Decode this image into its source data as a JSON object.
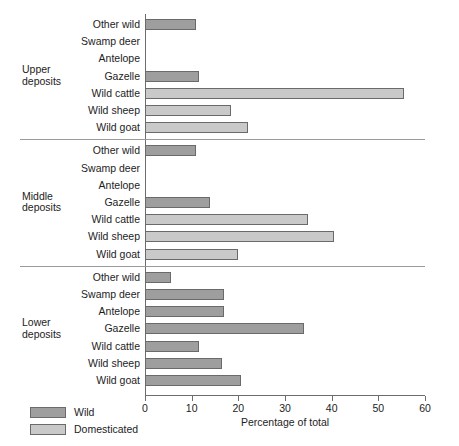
{
  "chart_data": {
    "type": "bar",
    "orientation": "horizontal",
    "title": "",
    "xlabel": "Percentage of total",
    "ylabel": "",
    "xlim": [
      0,
      60
    ],
    "xticks": [
      0,
      10,
      20,
      30,
      40,
      50,
      60
    ],
    "xticklabels": [
      "0",
      "10",
      "20",
      "30",
      "40",
      "50",
      "60"
    ],
    "grid": false,
    "legend": {
      "position": "bottom-left",
      "entries": [
        {
          "name": "Wild",
          "color": "#9e9e9e"
        },
        {
          "name": "Domesticated",
          "color": "#c9c9c9"
        }
      ]
    },
    "categories": [
      "Other wild",
      "Swamp deer",
      "Antelope",
      "Gazelle",
      "Wild cattle",
      "Wild sheep",
      "Wild goat"
    ],
    "groups": [
      {
        "name": "Upper\ndeposits",
        "name_lines": [
          "Upper",
          "deposits"
        ],
        "bars": [
          {
            "category": "Other wild",
            "value": 11,
            "series": "Wild"
          },
          {
            "category": "Swamp deer",
            "value": 0,
            "series": "Wild"
          },
          {
            "category": "Antelope",
            "value": 0,
            "series": "Wild"
          },
          {
            "category": "Gazelle",
            "value": 11.5,
            "series": "Wild"
          },
          {
            "category": "Wild cattle",
            "value": 55.5,
            "series": "Domesticated"
          },
          {
            "category": "Wild sheep",
            "value": 18.5,
            "series": "Domesticated"
          },
          {
            "category": "Wild goat",
            "value": 22,
            "series": "Domesticated"
          }
        ]
      },
      {
        "name": "Middle\ndeposits",
        "name_lines": [
          "Middle",
          "deposits"
        ],
        "bars": [
          {
            "category": "Other wild",
            "value": 11,
            "series": "Wild"
          },
          {
            "category": "Swamp deer",
            "value": 0,
            "series": "Wild"
          },
          {
            "category": "Antelope",
            "value": 0,
            "series": "Wild"
          },
          {
            "category": "Gazelle",
            "value": 14,
            "series": "Wild"
          },
          {
            "category": "Wild cattle",
            "value": 35,
            "series": "Domesticated"
          },
          {
            "category": "Wild sheep",
            "value": 40.5,
            "series": "Domesticated"
          },
          {
            "category": "Wild goat",
            "value": 20,
            "series": "Domesticated"
          }
        ]
      },
      {
        "name": "Lower\ndeposits",
        "name_lines": [
          "Lower",
          "deposits"
        ],
        "bars": [
          {
            "category": "Other wild",
            "value": 5.5,
            "series": "Wild"
          },
          {
            "category": "Swamp deer",
            "value": 17,
            "series": "Wild"
          },
          {
            "category": "Antelope",
            "value": 17,
            "series": "Wild"
          },
          {
            "category": "Gazelle",
            "value": 34,
            "series": "Wild"
          },
          {
            "category": "Wild cattle",
            "value": 11.5,
            "series": "Wild"
          },
          {
            "category": "Wild sheep",
            "value": 16.5,
            "series": "Wild"
          },
          {
            "category": "Wild goat",
            "value": 20.5,
            "series": "Wild"
          }
        ]
      }
    ]
  }
}
